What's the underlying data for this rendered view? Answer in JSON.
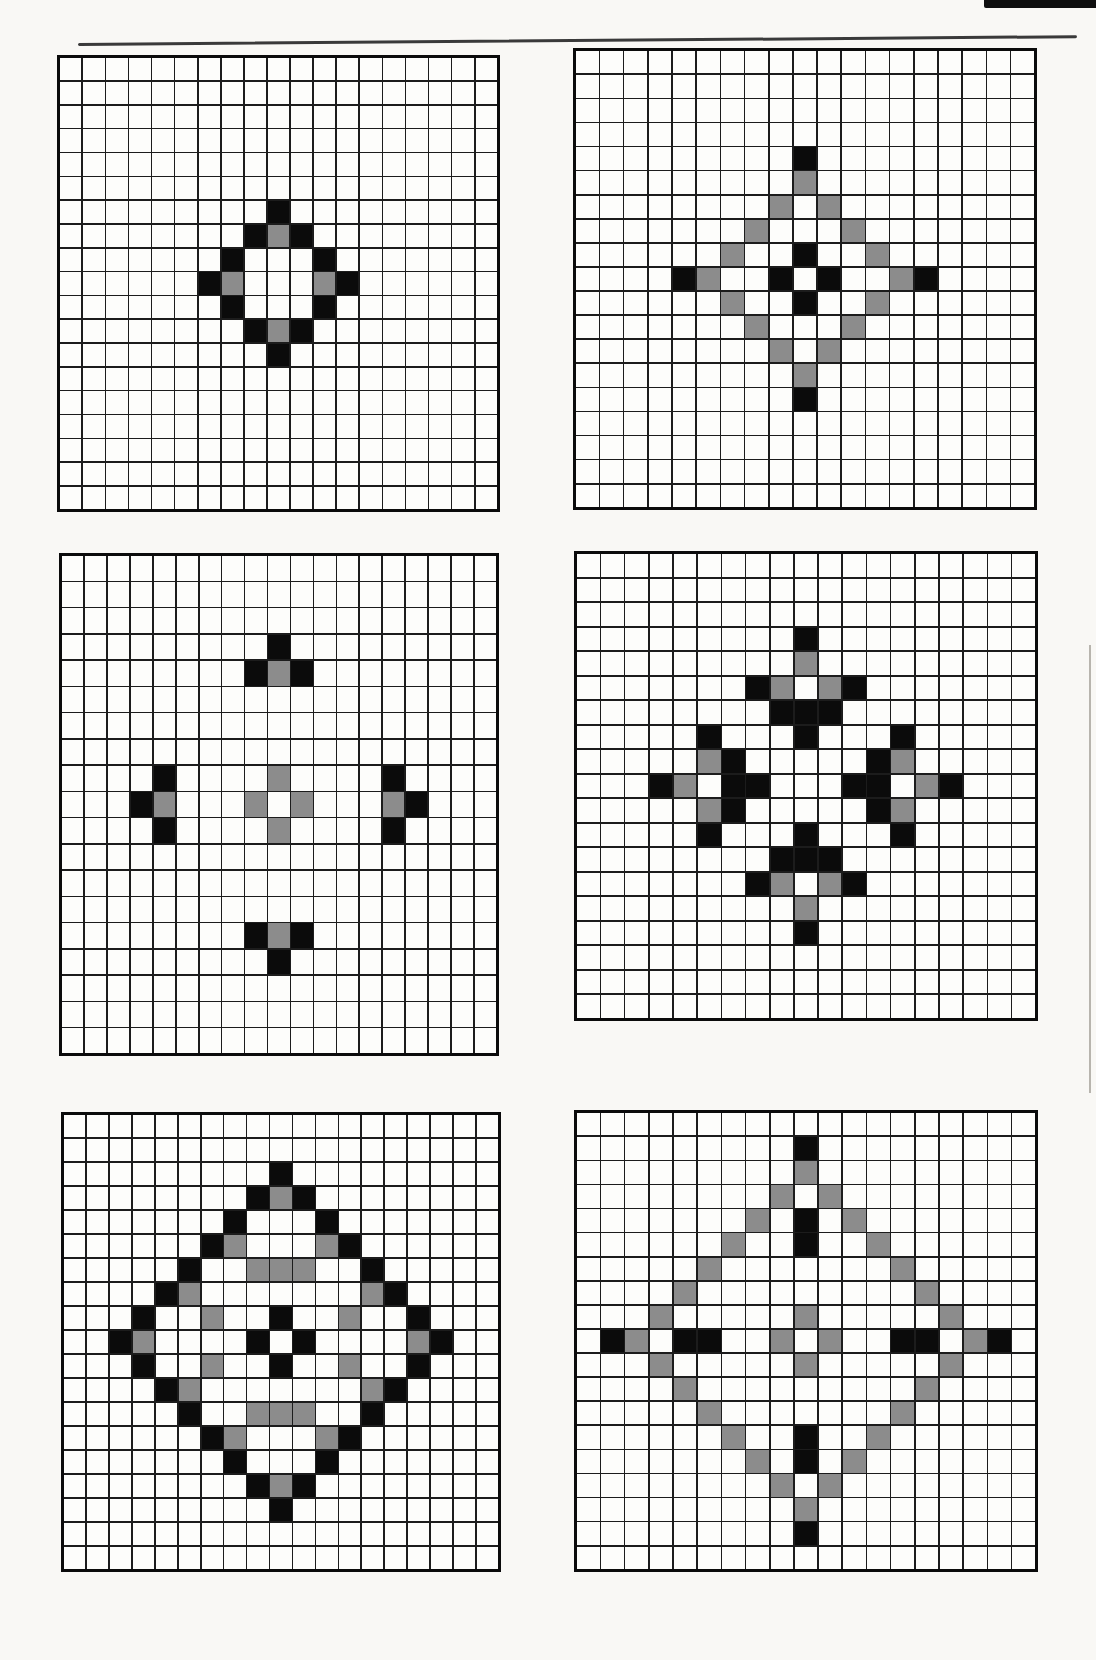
{
  "page": {
    "background_color": "#f9f8f5",
    "top_rule_color": "#3a3a3a",
    "header_fragment_color": "#0f0f0f",
    "page_edge_line_color": "#b8b5ae"
  },
  "grid": {
    "rows": 19,
    "cols": 19,
    "line_color": "#1c1c1c",
    "border_color": "#0b0b0b",
    "cell_color": "#fdfdfb",
    "black_color": "#0b0b0b",
    "gray_color": "#8c8c8c"
  },
  "panels": [
    {
      "id": "panel-1",
      "name": "diamond-ring-generation-1",
      "black_cells": [
        [
          6,
          9
        ],
        [
          7,
          8
        ],
        [
          7,
          10
        ],
        [
          8,
          7
        ],
        [
          8,
          11
        ],
        [
          9,
          6
        ],
        [
          9,
          12
        ],
        [
          10,
          7
        ],
        [
          10,
          11
        ],
        [
          11,
          8
        ],
        [
          11,
          10
        ],
        [
          12,
          9
        ]
      ],
      "gray_cells": [
        [
          7,
          9
        ],
        [
          9,
          7
        ],
        [
          9,
          11
        ],
        [
          11,
          9
        ]
      ]
    },
    {
      "id": "panel-2",
      "name": "gray-ring-plus-generation-2",
      "black_cells": [
        [
          4,
          9
        ],
        [
          9,
          4
        ],
        [
          8,
          9
        ],
        [
          9,
          8
        ],
        [
          9,
          10
        ],
        [
          10,
          9
        ],
        [
          9,
          14
        ],
        [
          14,
          9
        ]
      ],
      "gray_cells": [
        [
          5,
          9
        ],
        [
          6,
          8
        ],
        [
          6,
          10
        ],
        [
          7,
          7
        ],
        [
          7,
          11
        ],
        [
          8,
          6
        ],
        [
          8,
          12
        ],
        [
          9,
          5
        ],
        [
          9,
          13
        ],
        [
          10,
          6
        ],
        [
          10,
          12
        ],
        [
          11,
          7
        ],
        [
          11,
          11
        ],
        [
          12,
          8
        ],
        [
          12,
          10
        ],
        [
          13,
          9
        ]
      ]
    },
    {
      "id": "panel-3",
      "name": "four-tee-motifs-generation-3",
      "black_cells": [
        [
          3,
          9
        ],
        [
          4,
          8
        ],
        [
          4,
          10
        ],
        [
          8,
          4
        ],
        [
          9,
          3
        ],
        [
          10,
          4
        ],
        [
          8,
          14
        ],
        [
          9,
          15
        ],
        [
          10,
          14
        ],
        [
          14,
          8
        ],
        [
          14,
          10
        ],
        [
          15,
          9
        ]
      ],
      "gray_cells": [
        [
          4,
          9
        ],
        [
          9,
          4
        ],
        [
          9,
          14
        ],
        [
          14,
          9
        ],
        [
          8,
          9
        ],
        [
          9,
          8
        ],
        [
          9,
          10
        ],
        [
          10,
          9
        ]
      ]
    },
    {
      "id": "panel-4",
      "name": "snowflake-arms-generation-4",
      "black_cells": [
        [
          3,
          9
        ],
        [
          5,
          7
        ],
        [
          5,
          11
        ],
        [
          6,
          8
        ],
        [
          6,
          9
        ],
        [
          6,
          10
        ],
        [
          7,
          5
        ],
        [
          7,
          9
        ],
        [
          7,
          13
        ],
        [
          8,
          6
        ],
        [
          8,
          12
        ],
        [
          9,
          3
        ],
        [
          9,
          6
        ],
        [
          9,
          7
        ],
        [
          9,
          11
        ],
        [
          9,
          12
        ],
        [
          9,
          15
        ],
        [
          10,
          6
        ],
        [
          10,
          12
        ],
        [
          11,
          5
        ],
        [
          11,
          9
        ],
        [
          11,
          13
        ],
        [
          12,
          8
        ],
        [
          12,
          9
        ],
        [
          12,
          10
        ],
        [
          13,
          7
        ],
        [
          13,
          11
        ],
        [
          15,
          9
        ]
      ],
      "gray_cells": [
        [
          4,
          9
        ],
        [
          5,
          8
        ],
        [
          5,
          10
        ],
        [
          8,
          5
        ],
        [
          8,
          13
        ],
        [
          9,
          4
        ],
        [
          9,
          14
        ],
        [
          10,
          5
        ],
        [
          10,
          13
        ],
        [
          13,
          8
        ],
        [
          13,
          10
        ],
        [
          14,
          9
        ]
      ]
    },
    {
      "id": "panel-5",
      "name": "large-black-diamond-generation-5",
      "black_cells": [
        [
          2,
          9
        ],
        [
          3,
          8
        ],
        [
          3,
          10
        ],
        [
          4,
          7
        ],
        [
          4,
          11
        ],
        [
          5,
          6
        ],
        [
          5,
          12
        ],
        [
          6,
          5
        ],
        [
          6,
          13
        ],
        [
          7,
          4
        ],
        [
          7,
          14
        ],
        [
          8,
          3
        ],
        [
          8,
          15
        ],
        [
          9,
          2
        ],
        [
          9,
          16
        ],
        [
          10,
          3
        ],
        [
          10,
          15
        ],
        [
          11,
          4
        ],
        [
          11,
          14
        ],
        [
          12,
          5
        ],
        [
          12,
          13
        ],
        [
          13,
          6
        ],
        [
          13,
          12
        ],
        [
          14,
          7
        ],
        [
          14,
          11
        ],
        [
          15,
          8
        ],
        [
          15,
          10
        ],
        [
          16,
          9
        ],
        [
          8,
          9
        ],
        [
          9,
          8
        ],
        [
          9,
          10
        ],
        [
          10,
          9
        ]
      ],
      "gray_cells": [
        [
          3,
          9
        ],
        [
          5,
          7
        ],
        [
          5,
          11
        ],
        [
          6,
          8
        ],
        [
          6,
          9
        ],
        [
          6,
          10
        ],
        [
          7,
          5
        ],
        [
          7,
          13
        ],
        [
          8,
          6
        ],
        [
          8,
          12
        ],
        [
          9,
          3
        ],
        [
          9,
          15
        ],
        [
          10,
          6
        ],
        [
          10,
          12
        ],
        [
          11,
          5
        ],
        [
          11,
          13
        ],
        [
          12,
          8
        ],
        [
          12,
          9
        ],
        [
          12,
          10
        ],
        [
          13,
          7
        ],
        [
          13,
          11
        ],
        [
          15,
          9
        ]
      ]
    },
    {
      "id": "panel-6",
      "name": "gray-diamond-black-cross-generation-6",
      "black_cells": [
        [
          1,
          9
        ],
        [
          4,
          9
        ],
        [
          5,
          9
        ],
        [
          9,
          1
        ],
        [
          9,
          4
        ],
        [
          9,
          5
        ],
        [
          9,
          13
        ],
        [
          9,
          14
        ],
        [
          9,
          17
        ],
        [
          13,
          9
        ],
        [
          14,
          9
        ],
        [
          17,
          9
        ]
      ],
      "gray_cells": [
        [
          2,
          9
        ],
        [
          3,
          8
        ],
        [
          3,
          10
        ],
        [
          4,
          7
        ],
        [
          4,
          11
        ],
        [
          5,
          6
        ],
        [
          5,
          12
        ],
        [
          6,
          5
        ],
        [
          6,
          13
        ],
        [
          7,
          4
        ],
        [
          7,
          14
        ],
        [
          8,
          3
        ],
        [
          8,
          15
        ],
        [
          9,
          2
        ],
        [
          9,
          16
        ],
        [
          10,
          3
        ],
        [
          10,
          15
        ],
        [
          11,
          4
        ],
        [
          11,
          14
        ],
        [
          12,
          5
        ],
        [
          12,
          13
        ],
        [
          13,
          6
        ],
        [
          13,
          12
        ],
        [
          14,
          7
        ],
        [
          14,
          11
        ],
        [
          15,
          8
        ],
        [
          15,
          10
        ],
        [
          16,
          9
        ],
        [
          8,
          9
        ],
        [
          9,
          8
        ],
        [
          9,
          10
        ],
        [
          10,
          9
        ]
      ]
    }
  ]
}
